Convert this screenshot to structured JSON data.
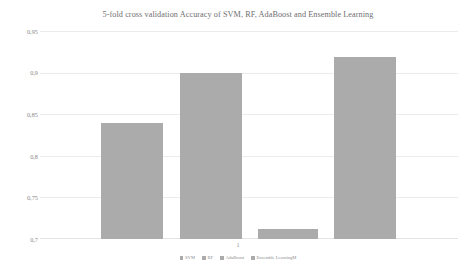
{
  "chart_data": {
    "type": "bar",
    "title": "5-fold cross validation Accuracy of SVM, RF, AdaBoost and Ensemble Learning",
    "xlabel": "",
    "ylabel": "",
    "categories": [
      "1"
    ],
    "x_tick_labels": [
      "1"
    ],
    "series": [
      {
        "name": "SVM",
        "values": [
          0.839
        ],
        "color": "#ababab"
      },
      {
        "name": "RF",
        "values": [
          0.9
        ],
        "color": "#ababab"
      },
      {
        "name": "AdaBoost",
        "values": [
          0.712
        ],
        "color": "#ababab"
      },
      {
        "name": "Ensemble LearningM",
        "values": [
          0.919
        ],
        "color": "#ababab"
      }
    ],
    "ylim": [
      0.7,
      0.95
    ],
    "y_tick_labels": [
      "0,95",
      "0,9",
      "0,85",
      "0,8",
      "0,75",
      "0,7"
    ],
    "y_tick_values": [
      0.95,
      0.9,
      0.85,
      0.8,
      0.75,
      0.7
    ],
    "grid": true,
    "legend_position": "bottom",
    "background_color": "#ffffff",
    "bar_color": "#ababab",
    "gridline_color": "#ececed",
    "text_color": "#6f6f6f"
  },
  "legend": {
    "items": [
      {
        "label": "SVM"
      },
      {
        "label": "RF"
      },
      {
        "label": "AdaBoost"
      },
      {
        "label": "Ensemble LearningM"
      }
    ]
  }
}
